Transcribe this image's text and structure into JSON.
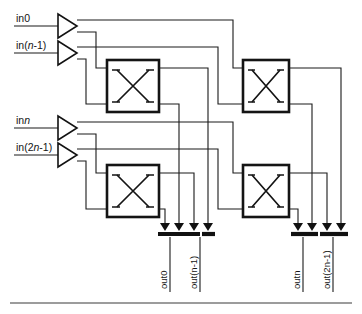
{
  "figure": {
    "name": "two-stage-switching-network",
    "colors": {
      "ink": "#141414",
      "wire": "#1a1a1a",
      "background": "#ffffff",
      "rule": "#3b3b3b"
    }
  },
  "inputs": [
    {
      "id": "in0",
      "pre": "in",
      "italic": "",
      "post": "0",
      "y": 26
    },
    {
      "id": "in_n1",
      "pre": "in(",
      "italic": "n",
      "post": "-1)",
      "y": 53
    },
    {
      "id": "in_n",
      "pre": "in",
      "italic": "n",
      "post": "",
      "y": 128
    },
    {
      "id": "in_2n1",
      "pre": "in(2",
      "italic": "n",
      "post": "-1)",
      "y": 155
    }
  ],
  "outputs": [
    {
      "id": "out0",
      "pre": "out",
      "italic": "",
      "post": "0",
      "x": 170
    },
    {
      "id": "out_n1",
      "pre": "out(",
      "italic": "n",
      "post": "-1)",
      "x": 200
    },
    {
      "id": "out_n",
      "pre": "out",
      "italic": "n",
      "post": "",
      "x": 303
    },
    {
      "id": "out_2n1",
      "pre": "out(2",
      "italic": "n",
      "post": "-1)",
      "x": 333
    }
  ],
  "switches": [
    {
      "id": "switch-stage1-top",
      "glyph": "X",
      "x": 107,
      "y": 60,
      "w": 52,
      "h": 52
    },
    {
      "id": "switch-stage1-bottom",
      "glyph": "X",
      "x": 107,
      "y": 165,
      "w": 52,
      "h": 52
    },
    {
      "id": "switch-stage2-top",
      "glyph": "X",
      "x": 243,
      "y": 60,
      "w": 46,
      "h": 52
    },
    {
      "id": "switch-stage2-bottom",
      "glyph": "X",
      "x": 243,
      "y": 165,
      "w": 46,
      "h": 52
    }
  ],
  "buffers": [
    {
      "id": "buffer-in0",
      "x": 58,
      "y": 14
    },
    {
      "id": "buffer-in-n1",
      "x": 58,
      "y": 41
    },
    {
      "id": "buffer-in-n",
      "x": 58,
      "y": 116
    },
    {
      "id": "buffer-in-2n1",
      "x": 58,
      "y": 143
    }
  ],
  "busbars": [
    {
      "id": "busbar-out0-out-n1",
      "x1": 160,
      "x2": 189,
      "y": 233
    },
    {
      "id": "busbar-out-n1-pair",
      "x1": 193,
      "x2": 222,
      "y": 233
    },
    {
      "id": "busbar-out-n",
      "x1": 293,
      "x2": 322,
      "y": 233
    },
    {
      "id": "busbar-out-2n1",
      "x1": 326,
      "x2": 355,
      "y": 233
    }
  ]
}
